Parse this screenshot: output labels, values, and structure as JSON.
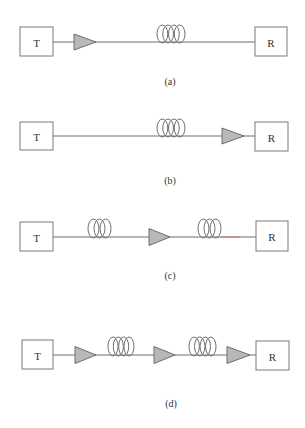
{
  "figure": {
    "width": 305,
    "height": 428,
    "colors": {
      "line": "#6e6e6e",
      "amplifier_fill": "#b8b8b8",
      "box_stroke": "#7a7a7a",
      "text": "#333333",
      "highlight_segment": "#d07070"
    },
    "panels": [
      {
        "id": "a",
        "caption": "(a)",
        "caption_pos": [
          170,
          81
        ],
        "line_y": 42,
        "transmitter": {
          "label": "T",
          "x": 20,
          "y": 27,
          "w": 33,
          "h": 29
        },
        "receiver": {
          "label": "R",
          "x": 255,
          "y": 27,
          "w": 32,
          "h": 29
        },
        "components": [
          {
            "type": "amplifier",
            "x1": 74,
            "x2": 96,
            "h": 16
          },
          {
            "type": "fiber-spool",
            "x1": 157,
            "x2": 185,
            "h": 18,
            "turns": 4
          }
        ],
        "highlight_segments": []
      },
      {
        "id": "b",
        "caption": "(b)",
        "caption_pos": [
          170,
          180
        ],
        "line_y": 136,
        "transmitter": {
          "label": "T",
          "x": 20,
          "y": 122,
          "w": 33,
          "h": 28
        },
        "receiver": {
          "label": "R",
          "x": 255,
          "y": 122,
          "w": 33,
          "h": 29
        },
        "components": [
          {
            "type": "fiber-spool",
            "x1": 157,
            "x2": 185,
            "h": 18,
            "turns": 4
          },
          {
            "type": "amplifier",
            "x1": 222,
            "x2": 244,
            "h": 16
          }
        ],
        "highlight_segments": []
      },
      {
        "id": "c",
        "caption": "(c)",
        "caption_pos": [
          170,
          275
        ],
        "line_y": 237,
        "transmitter": {
          "label": "T",
          "x": 20,
          "y": 222,
          "w": 33,
          "h": 29
        },
        "receiver": {
          "label": "R",
          "x": 256,
          "y": 221,
          "w": 32,
          "h": 30
        },
        "components": [
          {
            "type": "fiber-spool",
            "x1": 88,
            "x2": 111,
            "h": 19,
            "turns": 3
          },
          {
            "type": "amplifier",
            "x1": 149,
            "x2": 170,
            "h": 17
          },
          {
            "type": "fiber-spool",
            "x1": 198,
            "x2": 221,
            "h": 19,
            "turns": 3
          }
        ],
        "highlight_segments": [
          {
            "x1": 221,
            "x2": 240
          }
        ]
      },
      {
        "id": "d",
        "caption": "(d)",
        "caption_pos": [
          171,
          403
        ],
        "line_y": 355,
        "transmitter": {
          "label": "T",
          "x": 22,
          "y": 340,
          "w": 31,
          "h": 29
        },
        "receiver": {
          "label": "R",
          "x": 256,
          "y": 341,
          "w": 33,
          "h": 29
        },
        "components": [
          {
            "type": "amplifier",
            "x1": 75,
            "x2": 96,
            "h": 17
          },
          {
            "type": "fiber-spool",
            "x1": 108,
            "x2": 134,
            "h": 19,
            "turns": 4
          },
          {
            "type": "amplifier",
            "x1": 154,
            "x2": 175,
            "h": 17
          },
          {
            "type": "fiber-spool",
            "x1": 189,
            "x2": 216,
            "h": 19,
            "turns": 4
          },
          {
            "type": "amplifier",
            "x1": 227,
            "x2": 250,
            "h": 17
          }
        ],
        "highlight_segments": []
      }
    ]
  }
}
